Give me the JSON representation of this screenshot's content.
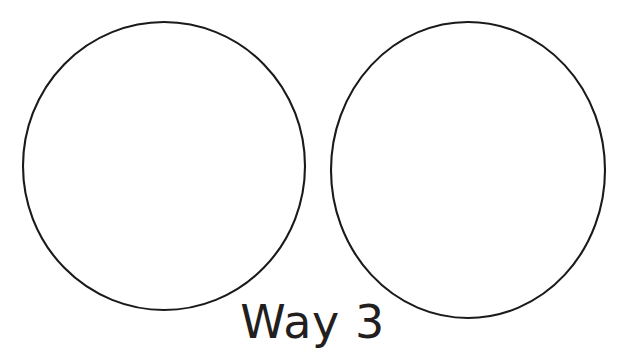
{
  "page": {
    "title": "Way 3",
    "background_color": "#ffffff",
    "width": 625,
    "height": 353
  },
  "caption": {
    "text": "Way 3",
    "color": "#231f20",
    "font_size_px": 46
  },
  "figure": {
    "type": "line-drawing",
    "stroke_color": "#1a1a1a",
    "fill_color": "#ffffff",
    "stroke_width_px": 2.1,
    "shapes": [
      {
        "name": "left-circle",
        "shape": "ellipse",
        "cx": 164,
        "cy": 166,
        "rx": 141,
        "ry": 144
      },
      {
        "name": "right-circle",
        "shape": "ellipse",
        "cx": 468,
        "cy": 170,
        "rx": 137,
        "ry": 148
      }
    ]
  }
}
